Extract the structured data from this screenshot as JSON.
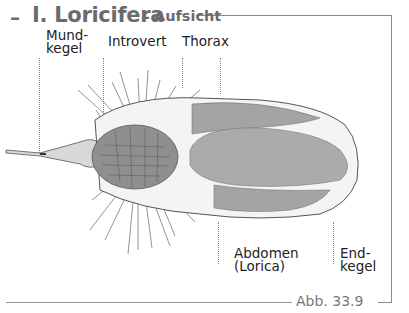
{
  "figure": {
    "title_dash": "–",
    "title": "I. Loricifera",
    "title_separator": "–",
    "subtitle": "Aufsicht",
    "caption": "Abb. 33.9",
    "labels_top": [
      {
        "id": "mundkegel",
        "line1": "Mund-",
        "line2": "kegel"
      },
      {
        "id": "introvert",
        "line1": "Introvert"
      },
      {
        "id": "thorax",
        "line1": "Thorax"
      }
    ],
    "labels_bottom": [
      {
        "id": "abdomen",
        "line1": "Abdomen",
        "line2": "(Lorica)"
      },
      {
        "id": "endkegel",
        "line1": "End-",
        "line2": "kegel"
      }
    ],
    "colors": {
      "frame": "#8a8a8a",
      "title": "#6b6b6b",
      "body_fill": "#a6a6a6",
      "introvert_fill": "#8f8f8f",
      "outline": "#555555"
    }
  }
}
